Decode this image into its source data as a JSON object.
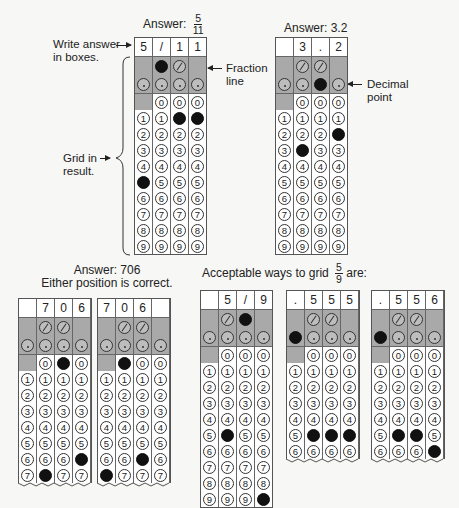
{
  "top": {
    "answer1": {
      "prefix": "Answer:",
      "numerator": "5",
      "denominator": "11"
    },
    "answer2": {
      "label": "Answer: 3.2"
    },
    "callouts": {
      "write_answer": [
        "Write answer",
        "in boxes."
      ],
      "grid_in": [
        "Grid in",
        "result."
      ],
      "fraction_line": [
        "Fraction",
        "line"
      ],
      "decimal_point": [
        "Decimal",
        "point"
      ]
    }
  },
  "bottom": {
    "answer706": [
      "Answer: 706",
      "Either position is correct."
    ],
    "acceptable": {
      "prefix": "Acceptable ways to grid",
      "numerator": "5",
      "denominator": "9",
      "suffix": "are:"
    }
  },
  "grids": [
    {
      "id": "grid-5-11",
      "header": [
        "5",
        "/",
        "1",
        "1"
      ],
      "fill": [
        "5",
        "/",
        "1",
        "1"
      ],
      "rows": 9
    },
    {
      "id": "grid-3-2",
      "header": [
        "",
        "3",
        ".",
        "2"
      ],
      "fill": [
        "",
        "3",
        ".",
        "2"
      ],
      "rows": 9
    },
    {
      "id": "grid-706-a",
      "header": [
        "",
        "7",
        "0",
        "6"
      ],
      "fill": [
        "",
        "7",
        "0",
        "6"
      ],
      "rows": 7
    },
    {
      "id": "grid-706-b",
      "header": [
        "7",
        "0",
        "6",
        ""
      ],
      "fill": [
        "7",
        "0",
        "6",
        ""
      ],
      "rows": 7
    },
    {
      "id": "grid-5-9",
      "header": [
        "",
        "5",
        "/",
        "9"
      ],
      "fill": [
        "",
        "5",
        "/",
        "9"
      ],
      "rows": 9
    },
    {
      "id": "grid-555",
      "header": [
        ".",
        "5",
        "5",
        "5"
      ],
      "fill": [
        ".",
        "5",
        "5",
        "5"
      ],
      "rows": 6
    },
    {
      "id": "grid-556",
      "header": [
        ".",
        "5",
        "5",
        "6"
      ],
      "fill": [
        ".",
        "5",
        "5",
        "6"
      ],
      "rows": 6
    }
  ],
  "colors": {
    "shade": "#a9a9a9",
    "filled_bubble": "#111111",
    "border": "#555555"
  }
}
